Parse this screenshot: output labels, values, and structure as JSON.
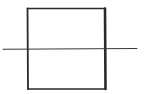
{
  "diagram": {
    "colors": {
      "background": "#ffffff",
      "stroke": "#2a2a2a"
    },
    "square": {
      "x": 27,
      "y": 8,
      "width": 78,
      "height": 81
    },
    "line": {
      "x1": 3,
      "y1": 49,
      "x2": 137,
      "y2": 48.5
    }
  }
}
